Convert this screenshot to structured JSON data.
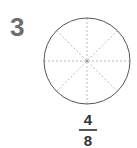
{
  "problem": {
    "number": "3",
    "divisions": 8,
    "shaded": 0,
    "fraction": {
      "numerator": "4",
      "denominator": "8"
    },
    "colors": {
      "number": "#6e6e6e",
      "outline": "#555555",
      "dashes": "#aaaaaa"
    }
  }
}
